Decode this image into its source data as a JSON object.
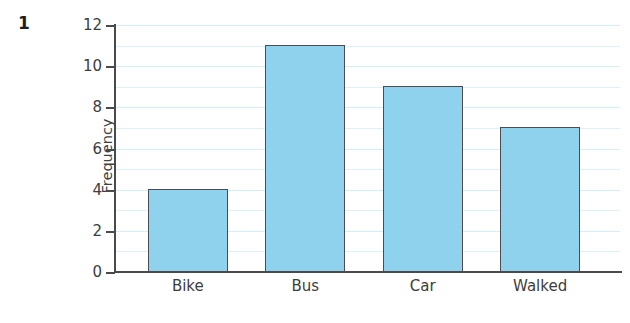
{
  "question_number": "1",
  "chart_data": {
    "type": "bar",
    "title": "",
    "xlabel": "",
    "ylabel": "Frequency",
    "categories": [
      "Bike",
      "Bus",
      "Car",
      "Walked"
    ],
    "values": [
      4,
      11,
      9,
      7
    ],
    "ylim": [
      0,
      12
    ],
    "y_tick_labels": [
      "0",
      "2",
      "4",
      "6",
      "8",
      "10",
      "12"
    ],
    "y_tick_values": [
      0,
      2,
      4,
      6,
      8,
      10,
      12
    ],
    "y_minor_gridline_values": [
      1,
      2,
      3,
      4,
      5,
      6,
      7,
      8,
      9,
      10,
      11,
      12
    ],
    "grid": true,
    "legend": false,
    "colors": {
      "bar_fill": "#8ed2ee",
      "bar_border": "#4c4c52",
      "gridline": "#ddf2f8",
      "axis": "#4a4a4a",
      "text": "#3d3d3d",
      "background": "#ffffff"
    }
  }
}
